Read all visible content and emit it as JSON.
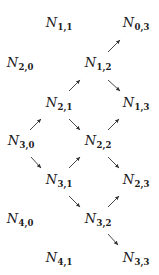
{
  "diagram": {
    "type": "lattice-graph",
    "node_symbol": "N",
    "nodes": [
      {
        "id": "1,1",
        "base": "N",
        "sub": "1,1",
        "x": 59,
        "y": 22
      },
      {
        "id": "0,3",
        "base": "N",
        "sub": "0,3",
        "x": 136,
        "y": 22
      },
      {
        "id": "2,0",
        "base": "N",
        "sub": "2,0",
        "x": 20,
        "y": 62
      },
      {
        "id": "1,2",
        "base": "N",
        "sub": "1,2",
        "x": 98,
        "y": 62
      },
      {
        "id": "2,1",
        "base": "N",
        "sub": "2,1",
        "x": 59,
        "y": 102
      },
      {
        "id": "1,3",
        "base": "N",
        "sub": "1,3",
        "x": 136,
        "y": 102
      },
      {
        "id": "3,0",
        "base": "N",
        "sub": "3,0",
        "x": 21,
        "y": 140
      },
      {
        "id": "2,2",
        "base": "N",
        "sub": "2,2",
        "x": 98,
        "y": 140
      },
      {
        "id": "3,1",
        "base": "N",
        "sub": "3,1",
        "x": 59,
        "y": 179
      },
      {
        "id": "2,3",
        "base": "N",
        "sub": "2,3",
        "x": 136,
        "y": 179
      },
      {
        "id": "4,0",
        "base": "N",
        "sub": "4,0",
        "x": 20,
        "y": 218
      },
      {
        "id": "3,2",
        "base": "N",
        "sub": "3,2",
        "x": 98,
        "y": 218
      },
      {
        "id": "4,1",
        "base": "N",
        "sub": "4,1",
        "x": 59,
        "y": 257
      },
      {
        "id": "3,3",
        "base": "N",
        "sub": "3,3",
        "x": 136,
        "y": 257
      }
    ],
    "edges": [
      {
        "from": "1,2",
        "to": "0,3",
        "dir": "up-right"
      },
      {
        "from": "2,1",
        "to": "1,2",
        "dir": "up-right"
      },
      {
        "from": "1,2",
        "to": "1,3",
        "dir": "down-right"
      },
      {
        "from": "3,0",
        "to": "2,1",
        "dir": "up-right"
      },
      {
        "from": "2,1",
        "to": "2,2",
        "dir": "down-right"
      },
      {
        "from": "2,2",
        "to": "1,3",
        "dir": "up-right"
      },
      {
        "from": "3,0",
        "to": "3,1",
        "dir": "down-right"
      },
      {
        "from": "3,1",
        "to": "2,2",
        "dir": "up-right"
      },
      {
        "from": "2,2",
        "to": "2,3",
        "dir": "down-right"
      },
      {
        "from": "3,1",
        "to": "3,2",
        "dir": "down-right"
      },
      {
        "from": "3,2",
        "to": "2,3",
        "dir": "up-right"
      },
      {
        "from": "3,2",
        "to": "3,3",
        "dir": "down-right"
      }
    ],
    "colors": {
      "text": "#1a1a1a",
      "arrow": "#333333",
      "background": "#ffffff"
    }
  }
}
